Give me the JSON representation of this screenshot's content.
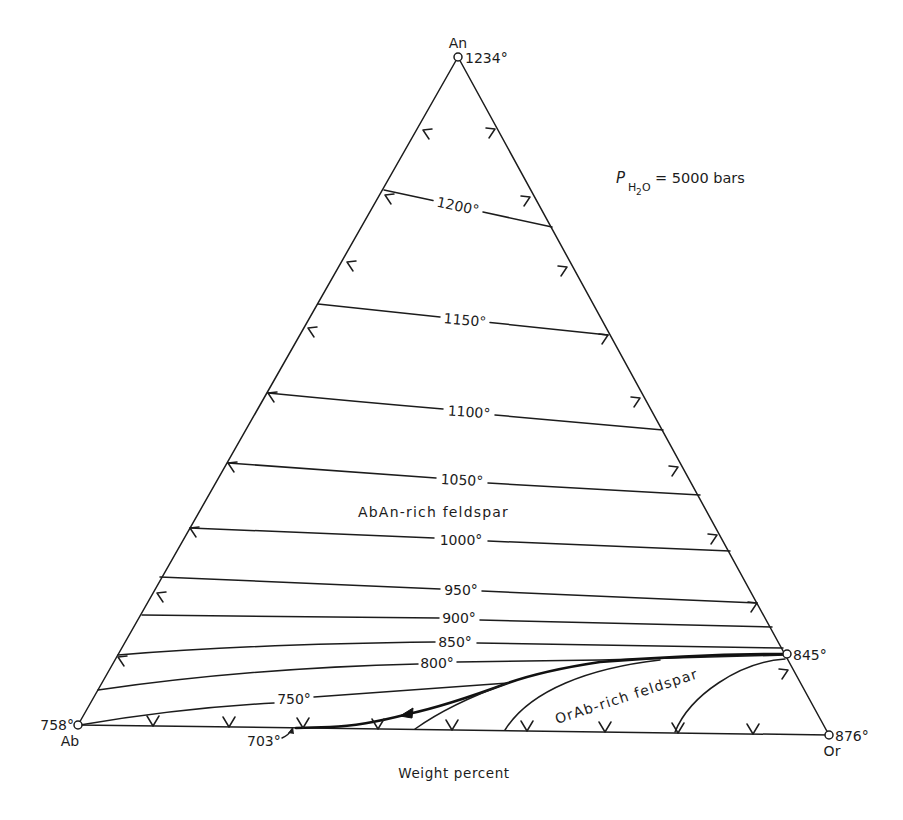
{
  "figure": {
    "vertices": {
      "an": {
        "label": "An",
        "temp": "1234°"
      },
      "ab": {
        "label": "Ab",
        "temp": "758°"
      },
      "or": {
        "label": "Or",
        "temp": "876°"
      }
    },
    "pressure": {
      "symbol": "P",
      "sub_h": "H",
      "sub_2": "2",
      "sub_o": "O",
      "value": "= 5000 bars"
    },
    "isotherms": [
      {
        "label": "1200°"
      },
      {
        "label": "1150°"
      },
      {
        "label": "1100°"
      },
      {
        "label": "1050°"
      },
      {
        "label": "1000°"
      },
      {
        "label": "950°"
      },
      {
        "label": "900°"
      },
      {
        "label": "850°"
      },
      {
        "label": "800°"
      },
      {
        "label": "750°"
      }
    ],
    "fields": {
      "abAn": "AbAn-rich feldspar",
      "orAb": "OrAb-rich feldspar"
    },
    "special_points": {
      "or_side_minimum": "845°",
      "base_minimum": "703°"
    },
    "caption": "Weight percent"
  },
  "diagram_data": {
    "type": "ternary-phase-diagram",
    "components": [
      "An",
      "Ab",
      "Or"
    ],
    "vertex_temperatures_C": {
      "An": 1234,
      "Ab": 758,
      "Or": 876
    },
    "pressure": "P(H2O) = 5000 bars",
    "isotherms_C": [
      1200,
      1150,
      1100,
      1050,
      1000,
      950,
      900,
      850,
      800,
      750
    ],
    "fields": [
      "AbAn-rich feldspar",
      "OrAb-rich feldspar"
    ],
    "points_C": {
      "An-Or join minimum": 845,
      "Ab-Or join minimum": 703
    },
    "units": "Weight percent"
  }
}
